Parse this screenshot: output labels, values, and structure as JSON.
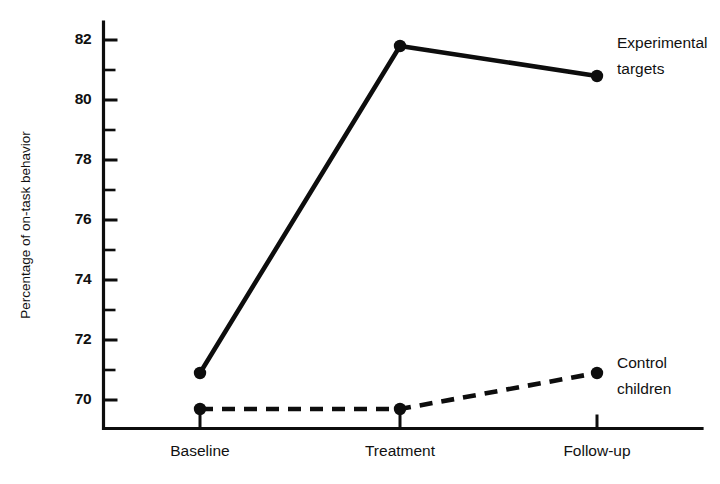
{
  "chart_data": {
    "type": "line",
    "title": "",
    "xlabel": "",
    "ylabel": "Percentage of on-task behavior",
    "categories": [
      "Baseline",
      "Treatment",
      "Follow-up"
    ],
    "ylim": [
      69.05,
      82.6
    ],
    "yticks_major": [
      70,
      72,
      74,
      76,
      78,
      80,
      82
    ],
    "yticks_major_labels": [
      "70",
      "72",
      "74",
      "76",
      "78",
      "80",
      "82"
    ],
    "yticks_minor": [
      71,
      73,
      75,
      77,
      79,
      81
    ],
    "grid": false,
    "legend_position": "inline-right",
    "series": [
      {
        "name": "Experimental targets",
        "label_line1": "Experimental",
        "label_line2": "targets",
        "style": "solid",
        "color": "#0d0d0d",
        "values": [
          70.9,
          81.8,
          80.8
        ]
      },
      {
        "name": "Control children",
        "label_line1": "Control",
        "label_line2": "children",
        "style": "dashed",
        "color": "#0d0d0d",
        "values": [
          69.7,
          69.7,
          70.9
        ]
      }
    ]
  },
  "axes": {
    "y_title": "Percentage of on-task behavior",
    "y_labels": [
      "82",
      "80",
      "78",
      "76",
      "74",
      "72",
      "70"
    ],
    "x_labels": [
      "Baseline",
      "Treatment",
      "Follow-up"
    ]
  },
  "annotations": {
    "experimental_line1": "Experimental",
    "experimental_line2": "targets",
    "control_line1": "Control",
    "control_line2": "children"
  }
}
